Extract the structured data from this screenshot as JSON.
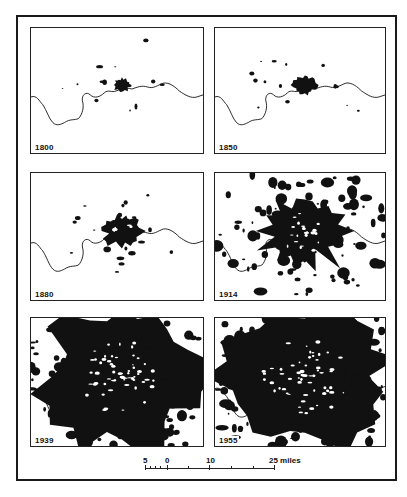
{
  "figure": {
    "panels": [
      {
        "year_label": "1800",
        "urban_extent": "small compact core",
        "river": true
      },
      {
        "year_label": "1850",
        "urban_extent": "expanded core",
        "river": true
      },
      {
        "year_label": "1880",
        "urban_extent": "core with radial extensions",
        "river": true
      },
      {
        "year_label": "1914",
        "urban_extent": "large sprawl with satellite patches",
        "river": true
      },
      {
        "year_label": "1939",
        "urban_extent": "continuous conurbation",
        "river": true
      },
      {
        "year_label": "1955",
        "urban_extent": "continuous conurbation",
        "river": true
      }
    ],
    "legend_fill": "#111111",
    "background": "#ffffff"
  },
  "scale_bar": {
    "labels": [
      "5",
      "0",
      "10",
      "25 miles"
    ],
    "values": [
      -5,
      0,
      10,
      25
    ],
    "unit": "miles"
  }
}
